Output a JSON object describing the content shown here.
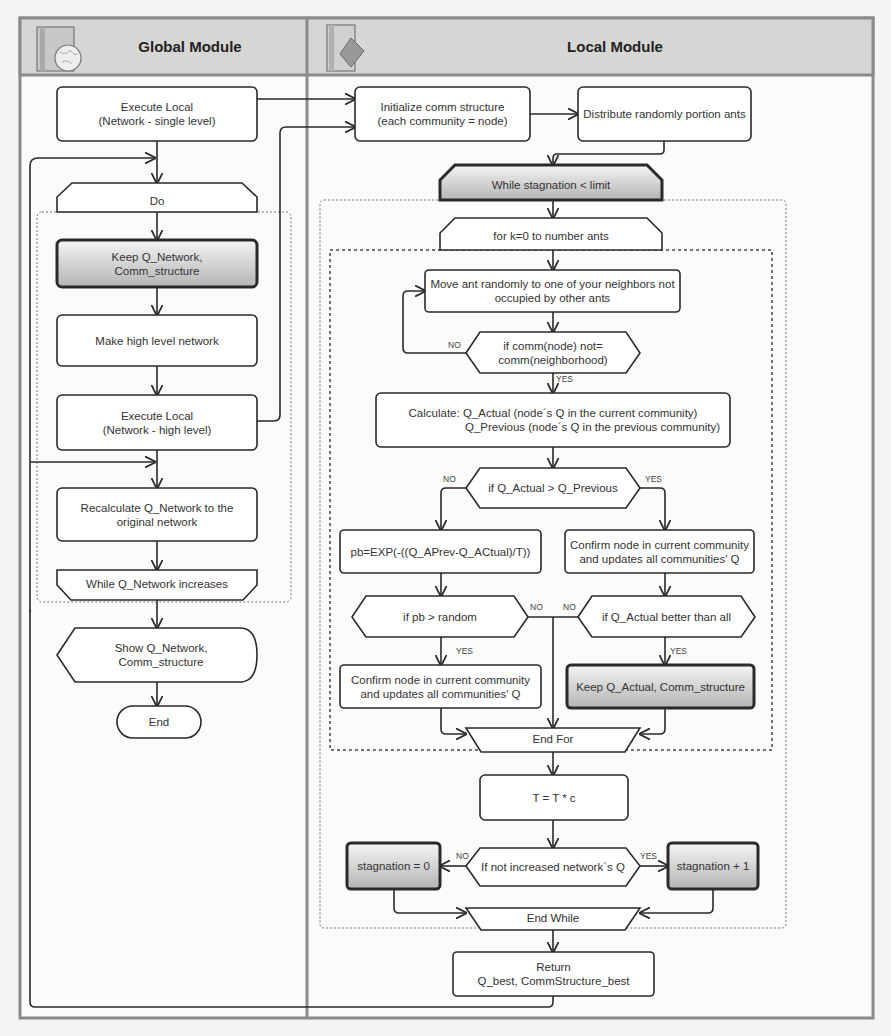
{
  "modules": {
    "global": {
      "title": "Global Module",
      "icon": "globe-book-icon"
    },
    "local": {
      "title": "Local Module",
      "icon": "diamond-book-icon"
    }
  },
  "global_flow": {
    "execute_local_single": "Execute Local\n(Network - single level)",
    "do": "Do",
    "keep_q_network": "Keep Q_Network,\nComm_structure",
    "make_high_level": "Make high level network",
    "execute_local_high": "Execute Local\n(Network - high level)",
    "recalculate": "Recalculate Q_Network to the\noriginal network",
    "while_q_network": "While Q_Network increases",
    "show": "Show Q_Network,\nComm_structure",
    "end": "End"
  },
  "local_flow": {
    "initialize": "Initialize comm structure\n(each community = node)",
    "distribute": "Distribute randomly portion ants",
    "while_stagnation": "While stagnation  < limit",
    "for_k": "for k=0 to number ants",
    "move_ant": "Move ant randomly to one of your neighbors not\noccupied by other ants",
    "if_comm": "if comm(node) not=\ncomm(neighborhood)",
    "calculate_line1": "Calculate: Q_Actual (node´s Q in the current community)",
    "calculate_line2": "Q_Previous (node´s Q in the previous community)",
    "if_q_actual_gt": "if Q_Actual > Q_Previous",
    "pb_formula": "pb=EXP(-((Q_APrev-Q_ACtual)/T))",
    "confirm_right": "Confirm node in current  community\nand updates all communities' Q",
    "if_pb_random": "if pb > random",
    "if_q_actual_better": "if Q_Actual better than all",
    "confirm_left": "Confirm node in current  community\nand updates all communities' Q",
    "keep_q_actual": "Keep Q_Actual, Comm_structure",
    "end_for": "End For",
    "t_update": "T = T * c",
    "stagnation_zero": "stagnation = 0",
    "if_not_increased": "If not increased network´s Q",
    "stagnation_plus": "stagnation + 1",
    "end_while": "End While",
    "return": "Return\nQ_best, CommStructure_best"
  },
  "edge_labels": {
    "no": "NO",
    "yes": "YES"
  },
  "colors": {
    "header_bg": "#d4d4d2",
    "frame": "#8a8a88",
    "highlight_top": "#f2f2f2",
    "highlight_bottom": "#b8b8b8",
    "line": "#2a2a2a"
  }
}
